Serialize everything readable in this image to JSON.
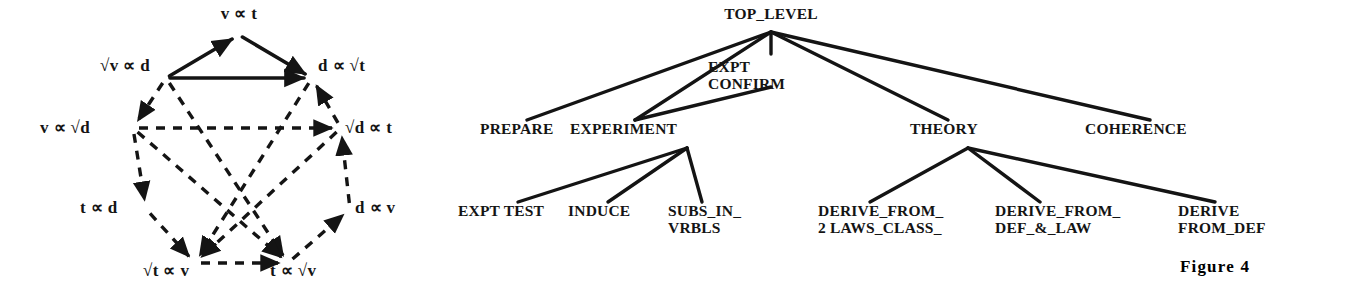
{
  "figure": {
    "caption": "Figure  4",
    "caption_x": 775,
    "caption_y": 272
  },
  "proportionality_graph": {
    "title": "",
    "edge_style_solid": "solid-arrow",
    "edge_style_dashed": "dashed-arrow",
    "color": "#141414",
    "nodes": [
      {
        "id": "v_t",
        "label": "v ∝ t",
        "x": 239,
        "y": 19,
        "anchor": "middle",
        "px": 239,
        "py": 35
      },
      {
        "id": "sqrtv_d",
        "label": "√v ∝ d",
        "x": 100,
        "y": 71,
        "anchor": "start",
        "px": 166,
        "py": 78
      },
      {
        "id": "d_sqrtt",
        "label": "d ∝ √t",
        "x": 318,
        "y": 71,
        "anchor": "start",
        "px": 312,
        "py": 78
      },
      {
        "id": "v_sqrtd",
        "label": "v ∝ √d",
        "x": 40,
        "y": 133,
        "anchor": "start",
        "px": 133,
        "py": 128
      },
      {
        "id": "sqrtd_t",
        "label": "√d ∝ t",
        "x": 345,
        "y": 133,
        "anchor": "start",
        "px": 341,
        "py": 128
      },
      {
        "id": "t_d",
        "label": "t ∝ d",
        "x": 80,
        "y": 213,
        "anchor": "start",
        "px": 146,
        "py": 209
      },
      {
        "id": "d_v",
        "label": "d ∝ v",
        "x": 355,
        "y": 213,
        "anchor": "start",
        "px": 350,
        "py": 209
      },
      {
        "id": "sqrtt_v",
        "label": "√t ∝ v",
        "x": 143,
        "y": 276,
        "anchor": "start",
        "px": 195,
        "py": 263
      },
      {
        "id": "t_sqrtv",
        "label": "t ∝ √v",
        "x": 270,
        "y": 276,
        "anchor": "start",
        "px": 288,
        "py": 263
      }
    ],
    "solid_edges": [
      {
        "from": "sqrtv_d",
        "to": "v_t"
      },
      {
        "from": "v_t",
        "to": "d_sqrtt"
      },
      {
        "from": "sqrtv_d",
        "to": "d_sqrtt"
      }
    ],
    "dashed_ring_edges": [
      {
        "from": "sqrtv_d",
        "to": "v_sqrtd"
      },
      {
        "from": "v_sqrtd",
        "to": "t_d"
      },
      {
        "from": "t_d",
        "to": "sqrtt_v"
      },
      {
        "from": "sqrtt_v",
        "to": "t_sqrtv"
      },
      {
        "from": "t_sqrtv",
        "to": "d_v"
      },
      {
        "from": "d_v",
        "to": "sqrtd_t"
      },
      {
        "from": "sqrtd_t",
        "to": "d_sqrtt"
      }
    ],
    "dashed_chord_edges": [
      {
        "from": "v_sqrtd",
        "to": "sqrtd_t"
      },
      {
        "from": "sqrtv_d",
        "to": "t_sqrtv"
      },
      {
        "from": "d_sqrtt",
        "to": "sqrtt_v"
      },
      {
        "from": "v_sqrtd",
        "to": "t_sqrtv"
      },
      {
        "from": "sqrtd_t",
        "to": "sqrtt_v"
      }
    ]
  },
  "tree_graph": {
    "color": "#141414",
    "root": {
      "id": "top_level",
      "label": "TOP_LEVEL",
      "x": 331,
      "y": 19,
      "anchor": "middle",
      "px": 331,
      "py": 32
    },
    "level_1": [
      {
        "id": "prepare",
        "label": "PREPARE",
        "x": 40,
        "y": 134,
        "anchor": "start",
        "px": 87,
        "py": 120
      },
      {
        "id": "experiment",
        "label": "EXPERIMENT",
        "x": 130,
        "y": 134,
        "anchor": "start",
        "px": 195,
        "py": 120
      },
      {
        "id": "expt_confirm",
        "label_line1": "EXPT",
        "label_line2": "CONFIRM",
        "x": 268,
        "y": 72,
        "anchor": "start",
        "px": 331,
        "py": 32
      },
      {
        "id": "theory",
        "label": "THEORY",
        "x": 470,
        "y": 134,
        "anchor": "start",
        "px": 508,
        "py": 120
      },
      {
        "id": "coherence",
        "label": "COHERENCE",
        "x": 645,
        "y": 134,
        "anchor": "start",
        "px": 710,
        "py": 120
      }
    ],
    "experiment_children": [
      {
        "id": "expt_test",
        "label_line1": "EXPT TEST",
        "label_line2": "",
        "x": 18,
        "y": 216,
        "anchor": "start",
        "px": 78,
        "py": 202
      },
      {
        "id": "induce",
        "label_line1": "INDUCE",
        "label_line2": "",
        "x": 128,
        "y": 216,
        "anchor": "start",
        "px": 168,
        "py": 202
      },
      {
        "id": "subs_in_vrbls",
        "label_line1": "SUBS_IN_",
        "label_line2": "VRBLS",
        "x": 228,
        "y": 216,
        "anchor": "start",
        "px": 262,
        "py": 202
      }
    ],
    "theory_children": [
      {
        "id": "derive_from_2laws",
        "label_line1": "DERIVE_FROM_",
        "label_line2": "2 LAWS_CLASS_",
        "x": 378,
        "y": 216,
        "anchor": "start",
        "px": 430,
        "py": 202
      },
      {
        "id": "derive_from_def_law",
        "label_line1": "DERIVE_FROM_",
        "label_line2": "DEF_&_LAW",
        "x": 555,
        "y": 216,
        "anchor": "start",
        "px": 600,
        "py": 202
      },
      {
        "id": "derive_from_def",
        "label_line1": "DERIVE",
        "label_line2": "FROM_DEF",
        "x": 738,
        "y": 216,
        "anchor": "start",
        "px": 775,
        "py": 202
      }
    ],
    "expt_confirm_edge": {
      "from_x": 331,
      "from_y": 32,
      "to_x": 195,
      "to_y": 120
    }
  }
}
